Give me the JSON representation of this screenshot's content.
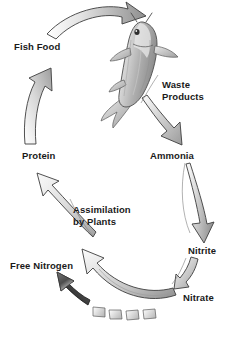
{
  "diagram": {
    "background_color": "#ffffff",
    "text_color": "#1a1a1a",
    "labels": {
      "fish_food": "Fish Food",
      "waste_products_line1": "Waste",
      "waste_products_line2": "Products",
      "ammonia": "Ammonia",
      "nitrite": "Nitrite",
      "nitrate": "Nitrate",
      "free_nitrogen": "Free Nitrogen",
      "assimilation_line1": "Assimilation",
      "assimilation_line2": "by Plants",
      "protein": "Protein"
    },
    "illustration": {
      "fish": "koi-fish",
      "fish_orientation": "vertical-head-up"
    },
    "arrows": [
      {
        "name": "fish-food-to-fish",
        "from": "Fish Food",
        "to": "Fish",
        "style": "curved-gradient",
        "direction": "right"
      },
      {
        "name": "fish-to-waste",
        "from": "Fish",
        "to": "Waste Products",
        "style": "tapered-gradient",
        "direction": "down-right"
      },
      {
        "name": "waste-to-ammonia",
        "from": "Waste Products",
        "to": "Ammonia",
        "style": "tapered-gradient",
        "direction": "down-right"
      },
      {
        "name": "ammonia-to-nitrite",
        "from": "Ammonia",
        "to": "Nitrite",
        "style": "tapered-gradient",
        "direction": "down"
      },
      {
        "name": "nitrite-to-nitrate",
        "from": "Nitrite",
        "to": "Nitrate",
        "style": "tapered-gradient",
        "direction": "down-left"
      },
      {
        "name": "nitrate-to-assimilation",
        "from": "Nitrate",
        "to": "Assimilation by Plants",
        "style": "curved-gradient",
        "direction": "up-left"
      },
      {
        "name": "assimilation-to-protein",
        "from": "Assimilation by Plants",
        "to": "Protein",
        "style": "tapered-gradient",
        "direction": "up-left"
      },
      {
        "name": "protein-to-fish-food",
        "from": "Protein",
        "to": "Fish Food",
        "style": "tapered-gradient",
        "direction": "up"
      },
      {
        "name": "nitrate-to-free-nitrogen",
        "from": "Nitrate",
        "to": "Free Nitrogen",
        "style": "dark-segmented-dashed",
        "direction": "up-left"
      }
    ],
    "colors": {
      "arrow_light": "#f2f2f2",
      "arrow_mid": "#b9b9b9",
      "arrow_dark": "#6e6e6e",
      "arrow_outline": "#4a4a4a",
      "dark_arrow": "#3a3a3a",
      "fish_body": "#cfcfcf",
      "fish_shadow": "#8a8a8a"
    }
  }
}
